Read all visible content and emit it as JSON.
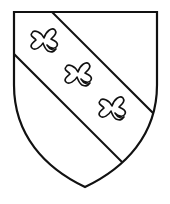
{
  "figure": {
    "charges_count": 3,
    "colors": {
      "field": "#ffffff",
      "outline": "#111111"
    }
  }
}
